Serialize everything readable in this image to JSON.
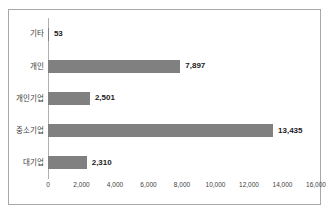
{
  "chart_data": {
    "type": "bar",
    "orientation": "horizontal",
    "title": "",
    "subtitle": "",
    "xlabel": "",
    "ylabel": "",
    "categories": [
      "대기업",
      "중소기업",
      "개인기업",
      "개인",
      "기타"
    ],
    "values": [
      2310,
      13435,
      2501,
      7897,
      53
    ],
    "value_labels": [
      "2,310",
      "13,435",
      "2,501",
      "7,897",
      "53"
    ],
    "xlim": [
      0,
      16000
    ],
    "xticks": [
      0,
      2000,
      4000,
      6000,
      8000,
      10000,
      12000,
      14000,
      16000
    ],
    "xtick_labels": [
      "0",
      "2,000",
      "4,000",
      "6,000",
      "8,000",
      "10,000",
      "12,000",
      "14,000",
      "16,000"
    ],
    "grid": false,
    "legend": null,
    "bar_color": "#808080",
    "axis_color": "#b0b0b0",
    "border_color": "#a8a8a8",
    "label_color": "#404040",
    "value_color": "#1c1c1c"
  }
}
